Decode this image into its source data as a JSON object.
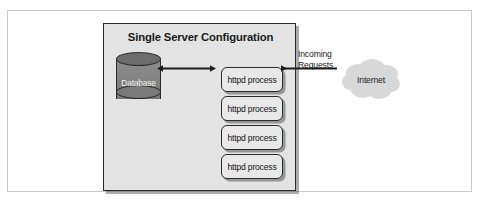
{
  "figure": {
    "panel_title": "Single Server Configuration",
    "colors": {
      "panel_fill": "#e3e3e3",
      "panel_border": "#2b2b2b",
      "box_fill": "#e8e8e8",
      "cylinder_body": "#848484",
      "cylinder_top": "#6d6d6d",
      "cloud_fill": "#d6d6d6",
      "text": "#1c1c1c",
      "frame_border": "#c9c9c9"
    }
  },
  "database": {
    "label": "Database"
  },
  "processes": [
    {
      "label": "httpd process"
    },
    {
      "label": "httpd process"
    },
    {
      "label": "httpd process"
    },
    {
      "label": "httpd process"
    }
  ],
  "network": {
    "incoming_line1": "Incoming",
    "incoming_line2": "Requests",
    "cloud_label": "Internet"
  }
}
